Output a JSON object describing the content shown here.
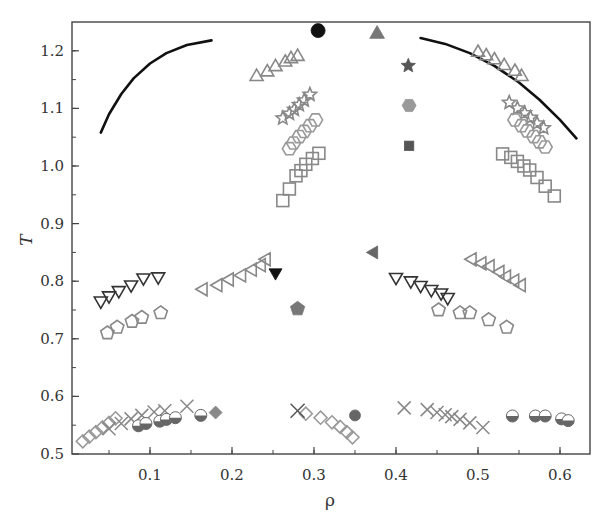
{
  "chart_data": {
    "type": "scatter",
    "title": "",
    "xlabel": "ρ",
    "ylabel": "T",
    "xlim": [
      0.0,
      0.63
    ],
    "ylim": [
      0.5,
      1.25
    ],
    "xticks": [
      0.1,
      0.2,
      0.3,
      0.4,
      0.5,
      0.6
    ],
    "xtick_labels": [
      "0.1",
      "0.2",
      "0.3",
      "0.4",
      "0.5",
      "0.6"
    ],
    "xminor_step": 0.05,
    "yticks": [
      0.5,
      0.6,
      0.7,
      0.8,
      0.9,
      1.0,
      1.1,
      1.2
    ],
    "ytick_labels": [
      "0.5",
      "0.6",
      "0.7",
      "0.8",
      "0.9",
      "1.0",
      "1.1",
      "1.2"
    ],
    "yminor_step": 0.05,
    "grid": false,
    "legend": null,
    "curves": [
      {
        "name": "coexistence curve (left branch)",
        "color": "#111111",
        "width": 2.6,
        "points": [
          [
            0.04,
            1.058
          ],
          [
            0.05,
            1.09
          ],
          [
            0.065,
            1.125
          ],
          [
            0.08,
            1.152
          ],
          [
            0.1,
            1.178
          ],
          [
            0.12,
            1.196
          ],
          [
            0.145,
            1.21
          ],
          [
            0.175,
            1.218
          ]
        ]
      },
      {
        "name": "coexistence curve (right branch)",
        "color": "#111111",
        "width": 2.6,
        "points": [
          [
            0.43,
            1.222
          ],
          [
            0.46,
            1.212
          ],
          [
            0.49,
            1.196
          ],
          [
            0.52,
            1.174
          ],
          [
            0.55,
            1.145
          ],
          [
            0.575,
            1.115
          ],
          [
            0.6,
            1.08
          ],
          [
            0.62,
            1.048
          ]
        ]
      }
    ],
    "series": [
      {
        "name": "open-triangle-up",
        "marker": "triangle-up",
        "filled": false,
        "color": "#888888",
        "size": 15,
        "points": [
          [
            0.23,
            1.155
          ],
          [
            0.243,
            1.163
          ],
          [
            0.253,
            1.172
          ],
          [
            0.265,
            1.18
          ],
          [
            0.272,
            1.186
          ],
          [
            0.28,
            1.19
          ],
          [
            0.5,
            1.197
          ],
          [
            0.51,
            1.191
          ],
          [
            0.52,
            1.184
          ],
          [
            0.532,
            1.174
          ],
          [
            0.545,
            1.164
          ],
          [
            0.553,
            1.155
          ]
        ]
      },
      {
        "name": "open-star",
        "marker": "star",
        "filled": false,
        "color": "#888888",
        "size": 14,
        "points": [
          [
            0.262,
            1.083
          ],
          [
            0.27,
            1.091
          ],
          [
            0.276,
            1.098
          ],
          [
            0.282,
            1.106
          ],
          [
            0.288,
            1.114
          ],
          [
            0.295,
            1.124
          ],
          [
            0.538,
            1.11
          ],
          [
            0.548,
            1.1
          ],
          [
            0.557,
            1.092
          ],
          [
            0.564,
            1.084
          ],
          [
            0.572,
            1.074
          ],
          [
            0.58,
            1.066
          ]
        ]
      },
      {
        "name": "open-hexagon",
        "marker": "hexagon",
        "filled": false,
        "color": "#999999",
        "size": 14,
        "points": [
          [
            0.27,
            1.03
          ],
          [
            0.275,
            1.04
          ],
          [
            0.282,
            1.051
          ],
          [
            0.288,
            1.06
          ],
          [
            0.295,
            1.07
          ],
          [
            0.302,
            1.08
          ],
          [
            0.545,
            1.08
          ],
          [
            0.553,
            1.07
          ],
          [
            0.56,
            1.061
          ],
          [
            0.568,
            1.051
          ],
          [
            0.575,
            1.042
          ],
          [
            0.582,
            1.033
          ]
        ]
      },
      {
        "name": "open-square",
        "marker": "square",
        "filled": false,
        "color": "#888888",
        "size": 14,
        "points": [
          [
            0.262,
            0.94
          ],
          [
            0.27,
            0.96
          ],
          [
            0.278,
            0.983
          ],
          [
            0.284,
            0.992
          ],
          [
            0.29,
            1.003
          ],
          [
            0.298,
            1.013
          ],
          [
            0.306,
            1.022
          ],
          [
            0.53,
            1.021
          ],
          [
            0.54,
            1.015
          ],
          [
            0.548,
            1.008
          ],
          [
            0.556,
            1.0
          ],
          [
            0.563,
            0.993
          ],
          [
            0.572,
            0.98
          ],
          [
            0.582,
            0.965
          ],
          [
            0.593,
            0.948
          ]
        ]
      },
      {
        "name": "open-triangle-down (dark)",
        "marker": "triangle-down",
        "filled": false,
        "color": "#333333",
        "size": 15,
        "points": [
          [
            0.04,
            0.766
          ],
          [
            0.05,
            0.775
          ],
          [
            0.062,
            0.784
          ],
          [
            0.077,
            0.794
          ],
          [
            0.092,
            0.806
          ],
          [
            0.11,
            0.808
          ],
          [
            0.4,
            0.807
          ],
          [
            0.418,
            0.801
          ],
          [
            0.43,
            0.793
          ],
          [
            0.443,
            0.786
          ],
          [
            0.455,
            0.78
          ],
          [
            0.463,
            0.772
          ]
        ]
      },
      {
        "name": "open-triangle-left",
        "marker": "triangle-left",
        "filled": false,
        "color": "#888888",
        "size": 15,
        "points": [
          [
            0.165,
            0.786
          ],
          [
            0.183,
            0.793
          ],
          [
            0.197,
            0.803
          ],
          [
            0.212,
            0.81
          ],
          [
            0.225,
            0.82
          ],
          [
            0.236,
            0.828
          ],
          [
            0.242,
            0.838
          ],
          [
            0.493,
            0.838
          ],
          [
            0.505,
            0.831
          ],
          [
            0.515,
            0.826
          ],
          [
            0.527,
            0.816
          ],
          [
            0.535,
            0.808
          ],
          [
            0.545,
            0.801
          ],
          [
            0.553,
            0.793
          ]
        ]
      },
      {
        "name": "open-pentagon",
        "marker": "pentagon",
        "filled": false,
        "color": "#888888",
        "size": 14,
        "points": [
          [
            0.048,
            0.71
          ],
          [
            0.06,
            0.72
          ],
          [
            0.078,
            0.73
          ],
          [
            0.09,
            0.737
          ],
          [
            0.113,
            0.745
          ],
          [
            0.452,
            0.75
          ],
          [
            0.478,
            0.745
          ],
          [
            0.49,
            0.745
          ],
          [
            0.513,
            0.733
          ],
          [
            0.535,
            0.72
          ]
        ]
      },
      {
        "name": "open-diamond",
        "marker": "diamond",
        "filled": false,
        "color": "#999999",
        "size": 13,
        "points": [
          [
            0.018,
            0.522
          ],
          [
            0.026,
            0.53
          ],
          [
            0.034,
            0.538
          ],
          [
            0.042,
            0.546
          ],
          [
            0.05,
            0.554
          ],
          [
            0.058,
            0.562
          ],
          [
            0.29,
            0.57
          ],
          [
            0.308,
            0.563
          ],
          [
            0.322,
            0.555
          ],
          [
            0.332,
            0.547
          ],
          [
            0.34,
            0.538
          ],
          [
            0.347,
            0.529
          ]
        ]
      },
      {
        "name": "cross",
        "marker": "x",
        "filled": false,
        "color": "#888888",
        "size": 13,
        "points": [
          [
            0.05,
            0.544
          ],
          [
            0.065,
            0.553
          ],
          [
            0.077,
            0.561
          ],
          [
            0.09,
            0.567
          ],
          [
            0.105,
            0.573
          ],
          [
            0.118,
            0.575
          ],
          [
            0.145,
            0.583
          ],
          [
            0.41,
            0.58
          ],
          [
            0.438,
            0.577
          ],
          [
            0.45,
            0.572
          ],
          [
            0.46,
            0.568
          ],
          [
            0.468,
            0.565
          ],
          [
            0.478,
            0.56
          ],
          [
            0.49,
            0.554
          ],
          [
            0.506,
            0.546
          ]
        ]
      },
      {
        "name": "half-filled-circle",
        "marker": "half-circle",
        "filled": "half",
        "color": "#666666",
        "size": 12,
        "points": [
          [
            0.086,
            0.549
          ],
          [
            0.095,
            0.553
          ],
          [
            0.112,
            0.557
          ],
          [
            0.12,
            0.56
          ],
          [
            0.131,
            0.563
          ],
          [
            0.162,
            0.567
          ],
          [
            0.542,
            0.566
          ],
          [
            0.57,
            0.566
          ],
          [
            0.582,
            0.566
          ],
          [
            0.602,
            0.561
          ],
          [
            0.61,
            0.558
          ]
        ]
      },
      {
        "name": "filled-diamond (critical point)",
        "marker": "diamond",
        "filled": true,
        "color": "#888888",
        "size": 13,
        "points": [
          [
            0.18,
            0.572
          ]
        ]
      },
      {
        "name": "cross (critical point)",
        "marker": "x",
        "filled": false,
        "color": "#555555",
        "size": 14,
        "points": [
          [
            0.28,
            0.575
          ]
        ]
      },
      {
        "name": "filled-circle (critical point, low T)",
        "marker": "circle",
        "filled": true,
        "color": "#666666",
        "size": 11,
        "points": [
          [
            0.35,
            0.567
          ]
        ]
      },
      {
        "name": "filled-triangle-down (critical point)",
        "marker": "triangle-down",
        "filled": true,
        "color": "#111111",
        "size": 15,
        "points": [
          [
            0.253,
            0.815
          ]
        ]
      },
      {
        "name": "filled-pentagon (critical point)",
        "marker": "pentagon",
        "filled": true,
        "color": "#777777",
        "size": 15,
        "points": [
          [
            0.28,
            0.752
          ]
        ]
      },
      {
        "name": "filled-triangle-left (critical point)",
        "marker": "triangle-left",
        "filled": true,
        "color": "#666666",
        "size": 15,
        "points": [
          [
            0.373,
            0.85
          ]
        ]
      },
      {
        "name": "filled-circle (critical point, high T)",
        "marker": "circle",
        "filled": true,
        "color": "#111111",
        "size": 14,
        "points": [
          [
            0.305,
            1.235
          ]
        ]
      },
      {
        "name": "filled-triangle-up (critical point)",
        "marker": "triangle-up",
        "filled": true,
        "color": "#777777",
        "size": 17,
        "points": [
          [
            0.377,
            1.229
          ]
        ]
      },
      {
        "name": "filled-star (critical point)",
        "marker": "star",
        "filled": true,
        "color": "#555555",
        "size": 15,
        "points": [
          [
            0.415,
            1.174
          ]
        ]
      },
      {
        "name": "filled-hexagon (critical point)",
        "marker": "hexagon",
        "filled": true,
        "color": "#999999",
        "size": 14,
        "points": [
          [
            0.416,
            1.105
          ]
        ]
      },
      {
        "name": "filled-square (critical point)",
        "marker": "square",
        "filled": true,
        "color": "#555555",
        "size": 11,
        "points": [
          [
            0.416,
            1.035
          ]
        ]
      }
    ]
  },
  "axes": {
    "x_label": "ρ",
    "y_label": "T"
  }
}
